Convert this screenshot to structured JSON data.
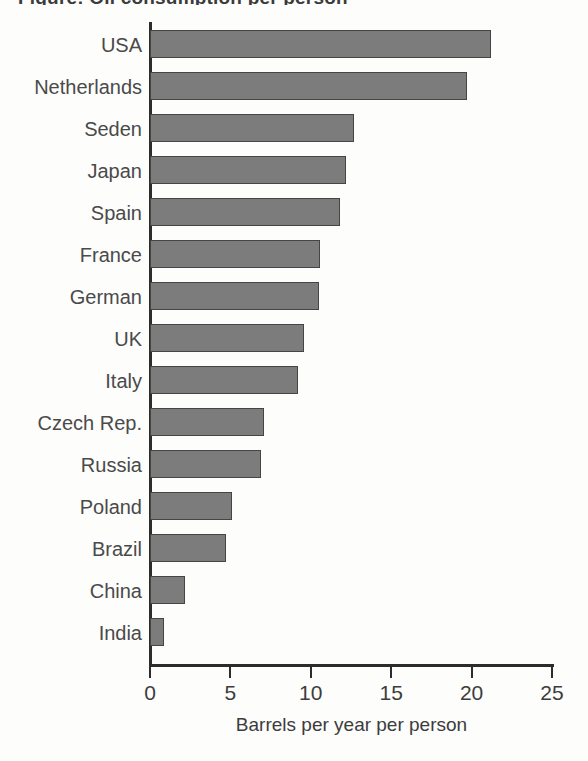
{
  "page": {
    "title_partial": "Figure: Oil consumption per person",
    "bottom_note": ""
  },
  "chart_data": {
    "type": "bar",
    "orientation": "horizontal",
    "title": "",
    "xlabel": "Barrels per year per person",
    "ylabel": "",
    "xlim": [
      0,
      25
    ],
    "xticks": [
      0,
      5,
      10,
      15,
      20,
      25
    ],
    "xtick_labels": [
      "0",
      "5",
      "10",
      "15",
      "20",
      "25"
    ],
    "grid": false,
    "legend": false,
    "bar_color": "#7c7c7c",
    "bar_edge_color": "#454545",
    "axis_color": "#2c2c2c",
    "categories": [
      "USA",
      "Netherlands",
      "Seden",
      "Japan",
      "Spain",
      "France",
      "German",
      "UK",
      "Italy",
      "Czech Rep.",
      "Russia",
      "Poland",
      "Brazil",
      "China",
      "India"
    ],
    "values": [
      21.2,
      19.7,
      12.7,
      12.2,
      11.8,
      10.6,
      10.5,
      9.6,
      9.2,
      7.1,
      6.9,
      5.1,
      4.7,
      2.2,
      0.9
    ]
  }
}
